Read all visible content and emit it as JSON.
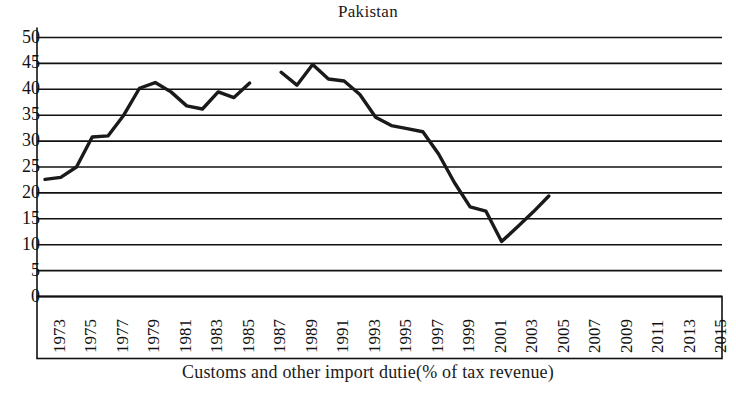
{
  "chart_data": {
    "type": "line",
    "title": "Pakistan",
    "xlabel": "Customs and other import dutie(% of tax revenue)",
    "ylabel": "",
    "xlim": [
      1973,
      2016
    ],
    "ylim": [
      0,
      50
    ],
    "grid": true,
    "legend": false,
    "y_ticks": [
      0,
      5,
      10,
      15,
      20,
      25,
      30,
      35,
      40,
      45,
      50
    ],
    "y_tick_labels": [
      "0",
      "5",
      "10",
      "15",
      "20",
      "25",
      "30",
      "35",
      "40",
      "45",
      "50"
    ],
    "x_tick_labels": [
      "1973",
      "1975",
      "1977",
      "1979",
      "1981",
      "1983",
      "1985",
      "1987",
      "1989",
      "1991",
      "1993",
      "1995",
      "1997",
      "1999",
      "2001",
      "2003",
      "2005",
      "2007",
      "2009",
      "2011",
      "2013",
      "2015"
    ],
    "line_color": "#1a1a1a",
    "series": [
      {
        "name": "Customs and other import duties (% of tax revenue)",
        "x": [
          1973,
          1974,
          1975,
          1976,
          1977,
          1978,
          1979,
          1980,
          1981,
          1982,
          1983,
          1984,
          1985,
          1986
        ],
        "values": [
          22.6,
          23.0,
          25.0,
          30.8,
          31.0,
          35.0,
          40.2,
          41.3,
          39.5,
          36.8,
          36.2,
          39.5,
          38.4,
          41.2
        ]
      },
      {
        "name": "Customs and other import duties (% of tax revenue) cont.",
        "x": [
          1988,
          1989,
          1990,
          1991,
          1992,
          1993,
          1994,
          1995,
          1996,
          1997,
          1998,
          1999,
          2000,
          2001,
          2002,
          2003,
          2004,
          2005
        ],
        "values": [
          43.3,
          40.8,
          44.8,
          42.0,
          41.6,
          39.0,
          34.6,
          33.0,
          32.4,
          31.8,
          27.5,
          22.0,
          17.3,
          16.5,
          10.6,
          13.4,
          16.3,
          19.4
        ]
      }
    ],
    "gap_note": "no data plotted for 1987 (break in line)"
  },
  "figure": {
    "title_text": "Pakistan",
    "caption_text": "Customs and other import dutie(% of tax revenue)"
  }
}
